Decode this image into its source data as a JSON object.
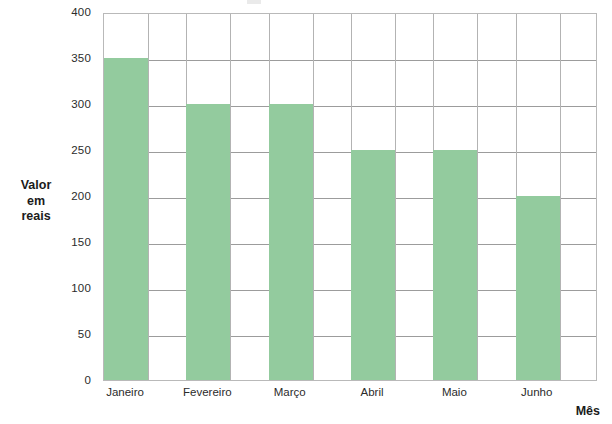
{
  "chart_data": {
    "type": "bar",
    "title": "",
    "subtitle": "",
    "xlabel": "Mês",
    "ylabel": "Valor em reais",
    "ylabel_lines": [
      "Valor",
      "em",
      "reais"
    ],
    "categories": [
      "Janeiro",
      "Fevereiro",
      "Março",
      "Abril",
      "Maio",
      "Junho"
    ],
    "values": [
      350,
      300,
      300,
      250,
      250,
      200
    ],
    "ylim": [
      0,
      400
    ],
    "yticks": [
      0,
      50,
      100,
      150,
      200,
      250,
      300,
      350,
      400
    ],
    "ytick_labels": [
      "0",
      "50",
      "100",
      "150",
      "200",
      "250",
      "300",
      "350",
      "400"
    ],
    "grid": "horizontal-and-vertical",
    "legend": null,
    "bar_color": "#93cb9e",
    "grid_color": "#9c9c9c",
    "axis_color": "#b9b9b9",
    "series": [
      {
        "name": "Valor em reais",
        "values": [
          350,
          300,
          300,
          250,
          250,
          200
        ]
      }
    ]
  },
  "axes": {
    "y_title": "Valor em reais",
    "x_title": "Mês"
  }
}
